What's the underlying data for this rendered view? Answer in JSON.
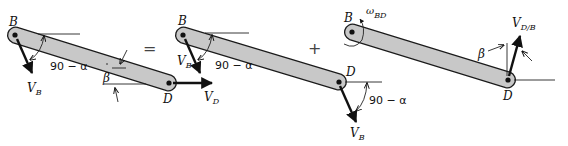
{
  "figures": [
    {
      "id": "absolute",
      "point_b": "B",
      "point_d": "D",
      "vectors": [
        {
          "label": "V",
          "sub": "B"
        },
        {
          "label": "V",
          "sub": "D"
        }
      ],
      "angles": {
        "alpha_label": "90 − α",
        "beta_label": "β"
      }
    },
    {
      "id": "translation",
      "point_b": "B",
      "point_d": "D",
      "vectors": [
        {
          "label": "V",
          "sub": "B"
        },
        {
          "label": "V",
          "sub": "B"
        }
      ],
      "angles": {
        "alpha_label": "90 − α",
        "alpha_label_2": "90 − α"
      }
    },
    {
      "id": "rotation",
      "point_b": "B",
      "point_d": "D",
      "omega": {
        "label": "ω",
        "sub": "BD"
      },
      "vectors": [
        {
          "label": "V",
          "sub": "D/B"
        }
      ],
      "angles": {
        "beta_label": "β"
      }
    }
  ],
  "operators": {
    "equals": "=",
    "plus": "+"
  }
}
